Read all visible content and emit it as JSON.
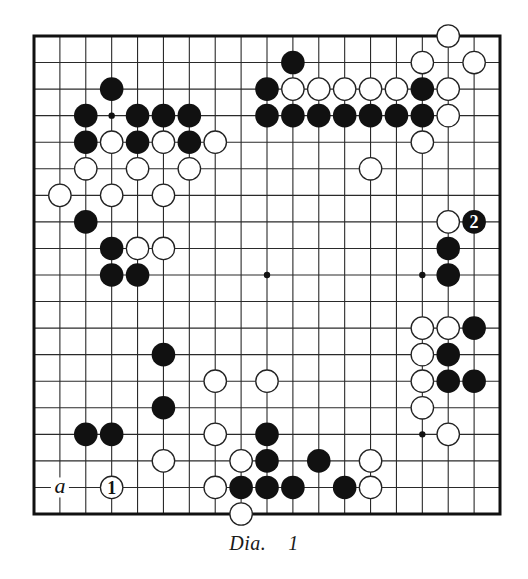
{
  "diagram": {
    "type": "go-board",
    "size": 19,
    "caption": {
      "prefix": "Dia.",
      "number": "1"
    },
    "colors": {
      "black": "#111111",
      "white": "#ffffff",
      "line": "#2a2a2a",
      "background": "#ffffff"
    },
    "hoshi": [
      [
        3,
        3
      ],
      [
        9,
        3
      ],
      [
        15,
        3
      ],
      [
        3,
        9
      ],
      [
        9,
        9
      ],
      [
        15,
        9
      ],
      [
        3,
        15
      ],
      [
        9,
        15
      ],
      [
        15,
        15
      ]
    ],
    "stones": [
      {
        "c": 3,
        "r": 2,
        "color": "black"
      },
      {
        "c": 10,
        "r": 1,
        "color": "black"
      },
      {
        "c": 16,
        "r": 0,
        "color": "white"
      },
      {
        "c": 15,
        "r": 1,
        "color": "white"
      },
      {
        "c": 17,
        "r": 1,
        "color": "white"
      },
      {
        "c": 2,
        "r": 3,
        "color": "black"
      },
      {
        "c": 4,
        "r": 3,
        "color": "black"
      },
      {
        "c": 5,
        "r": 3,
        "color": "black"
      },
      {
        "c": 6,
        "r": 3,
        "color": "black"
      },
      {
        "c": 9,
        "r": 2,
        "color": "black"
      },
      {
        "c": 10,
        "r": 2,
        "color": "white"
      },
      {
        "c": 11,
        "r": 2,
        "color": "white"
      },
      {
        "c": 12,
        "r": 2,
        "color": "white"
      },
      {
        "c": 13,
        "r": 2,
        "color": "white"
      },
      {
        "c": 14,
        "r": 2,
        "color": "white"
      },
      {
        "c": 15,
        "r": 2,
        "color": "black"
      },
      {
        "c": 16,
        "r": 2,
        "color": "white"
      },
      {
        "c": 9,
        "r": 3,
        "color": "black"
      },
      {
        "c": 10,
        "r": 3,
        "color": "black"
      },
      {
        "c": 11,
        "r": 3,
        "color": "black"
      },
      {
        "c": 12,
        "r": 3,
        "color": "black"
      },
      {
        "c": 13,
        "r": 3,
        "color": "black"
      },
      {
        "c": 14,
        "r": 3,
        "color": "black"
      },
      {
        "c": 15,
        "r": 3,
        "color": "black"
      },
      {
        "c": 16,
        "r": 3,
        "color": "white"
      },
      {
        "c": 2,
        "r": 4,
        "color": "black"
      },
      {
        "c": 3,
        "r": 4,
        "color": "white"
      },
      {
        "c": 4,
        "r": 4,
        "color": "black"
      },
      {
        "c": 5,
        "r": 4,
        "color": "white"
      },
      {
        "c": 6,
        "r": 4,
        "color": "black"
      },
      {
        "c": 7,
        "r": 4,
        "color": "white"
      },
      {
        "c": 15,
        "r": 4,
        "color": "white"
      },
      {
        "c": 2,
        "r": 5,
        "color": "white"
      },
      {
        "c": 4,
        "r": 5,
        "color": "white"
      },
      {
        "c": 6,
        "r": 5,
        "color": "white"
      },
      {
        "c": 13,
        "r": 5,
        "color": "white"
      },
      {
        "c": 1,
        "r": 6,
        "color": "white"
      },
      {
        "c": 3,
        "r": 6,
        "color": "white"
      },
      {
        "c": 5,
        "r": 6,
        "color": "white"
      },
      {
        "c": 2,
        "r": 7,
        "color": "black"
      },
      {
        "c": 16,
        "r": 7,
        "color": "white"
      },
      {
        "c": 17,
        "r": 7,
        "color": "black",
        "label": "2"
      },
      {
        "c": 3,
        "r": 8,
        "color": "black"
      },
      {
        "c": 4,
        "r": 8,
        "color": "white"
      },
      {
        "c": 5,
        "r": 8,
        "color": "white"
      },
      {
        "c": 16,
        "r": 8,
        "color": "black"
      },
      {
        "c": 3,
        "r": 9,
        "color": "black"
      },
      {
        "c": 4,
        "r": 9,
        "color": "black"
      },
      {
        "c": 16,
        "r": 9,
        "color": "black"
      },
      {
        "c": 15,
        "r": 11,
        "color": "white"
      },
      {
        "c": 16,
        "r": 11,
        "color": "white"
      },
      {
        "c": 17,
        "r": 11,
        "color": "black"
      },
      {
        "c": 5,
        "r": 12,
        "color": "black"
      },
      {
        "c": 15,
        "r": 12,
        "color": "white"
      },
      {
        "c": 16,
        "r": 12,
        "color": "black"
      },
      {
        "c": 7,
        "r": 13,
        "color": "white"
      },
      {
        "c": 9,
        "r": 13,
        "color": "white"
      },
      {
        "c": 15,
        "r": 13,
        "color": "white"
      },
      {
        "c": 16,
        "r": 13,
        "color": "black"
      },
      {
        "c": 17,
        "r": 13,
        "color": "black"
      },
      {
        "c": 5,
        "r": 14,
        "color": "black"
      },
      {
        "c": 15,
        "r": 14,
        "color": "white"
      },
      {
        "c": 2,
        "r": 15,
        "color": "black"
      },
      {
        "c": 3,
        "r": 15,
        "color": "black"
      },
      {
        "c": 7,
        "r": 15,
        "color": "white"
      },
      {
        "c": 9,
        "r": 15,
        "color": "black"
      },
      {
        "c": 16,
        "r": 15,
        "color": "white"
      },
      {
        "c": 5,
        "r": 16,
        "color": "white"
      },
      {
        "c": 8,
        "r": 16,
        "color": "white"
      },
      {
        "c": 9,
        "r": 16,
        "color": "black"
      },
      {
        "c": 11,
        "r": 16,
        "color": "black"
      },
      {
        "c": 13,
        "r": 16,
        "color": "white"
      },
      {
        "c": 3,
        "r": 17,
        "color": "white",
        "label": "1"
      },
      {
        "c": 7,
        "r": 17,
        "color": "white"
      },
      {
        "c": 8,
        "r": 17,
        "color": "black"
      },
      {
        "c": 9,
        "r": 17,
        "color": "black"
      },
      {
        "c": 10,
        "r": 17,
        "color": "black"
      },
      {
        "c": 12,
        "r": 17,
        "color": "black"
      },
      {
        "c": 13,
        "r": 17,
        "color": "white"
      },
      {
        "c": 8,
        "r": 18,
        "color": "white"
      }
    ],
    "point_labels": [
      {
        "c": 1,
        "r": 17,
        "text": "a"
      }
    ]
  }
}
